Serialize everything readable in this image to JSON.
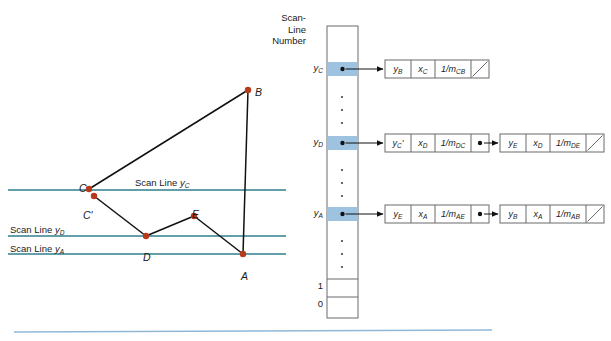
{
  "figure": {
    "title_header": "Scan-\nLine\nNumber",
    "header_lines": [
      "Scan-",
      "Line",
      "Number"
    ]
  },
  "colors": {
    "scanline": "#2e7f8c",
    "vertex": "#b83a1a",
    "highlight": "#9dc3e0",
    "edge": "#111111",
    "box_border": "#6b6b6b",
    "bottom_rule": "#8fb8d8"
  },
  "polygon": {
    "vertices": [
      {
        "id": "B",
        "label": "B",
        "x": 248,
        "y": 90,
        "label_dx": 7,
        "label_dy": -4
      },
      {
        "id": "C",
        "label": "C",
        "x": 89,
        "y": 189,
        "label_dx": -10,
        "label_dy": -7
      },
      {
        "id": "Cp",
        "label": "C'",
        "x": 94,
        "y": 196,
        "label_dx": -11,
        "label_dy": 13
      },
      {
        "id": "D",
        "label": "D",
        "x": 146,
        "y": 236,
        "label_dx": -3,
        "label_dy": 15
      },
      {
        "id": "E",
        "label": "E",
        "x": 194,
        "y": 216,
        "label_dx": -2,
        "label_dy": -8
      },
      {
        "id": "A",
        "label": "A",
        "x": 243,
        "y": 254,
        "label_dx": -2,
        "label_dy": 16
      }
    ],
    "edges": [
      {
        "from": "C",
        "to": "B"
      },
      {
        "from": "B",
        "to": "A"
      },
      {
        "from": "Cp",
        "to": "D"
      },
      {
        "from": "D",
        "to": "E"
      },
      {
        "from": "E",
        "to": "A"
      }
    ]
  },
  "scan_lines": [
    {
      "id": "yC",
      "label": "Scan Line y",
      "sub": "C",
      "y": 190,
      "x1": 8,
      "x2": 286,
      "label_x": 135,
      "label_y": 177,
      "label_align": "left"
    },
    {
      "id": "yD",
      "label": "Scan Line y",
      "sub": "D",
      "y": 236,
      "x1": 8,
      "x2": 286,
      "label_x": 10,
      "label_y": 224,
      "label_align": "left"
    },
    {
      "id": "yA",
      "label": "Scan Line y",
      "sub": "A",
      "y": 254,
      "x1": 8,
      "x2": 286,
      "label_x": 10,
      "label_y": 243,
      "label_align": "left"
    }
  ],
  "bottom_rule": {
    "y": 332,
    "x1": 14,
    "x2": 492
  },
  "scan_table": {
    "x": 327,
    "y_top": 26,
    "width": 31,
    "y_bottom": 318,
    "header_x": 288,
    "header_y": 12,
    "rows": [
      {
        "label": "y",
        "sub": "C",
        "y": 69,
        "highlight": true,
        "has_pointer": true
      },
      {
        "label": "y",
        "sub": "D",
        "y": 143,
        "highlight": true,
        "has_pointer": true
      },
      {
        "label": "y",
        "sub": "A",
        "y": 214,
        "highlight": true,
        "has_pointer": true
      },
      {
        "label": "1",
        "sub": "",
        "y": 287,
        "highlight": false,
        "has_pointer": false
      },
      {
        "label": "0",
        "sub": "",
        "y": 305,
        "highlight": false,
        "has_pointer": false
      }
    ],
    "dot_groups": [
      {
        "x": 342,
        "ys": [
          97,
          110,
          123
        ]
      },
      {
        "x": 342,
        "ys": [
          170,
          183,
          196
        ]
      },
      {
        "x": 342,
        "ys": [
          241,
          254,
          267
        ]
      }
    ]
  },
  "edge_lists": [
    {
      "row": "yC",
      "y": 69,
      "nodes": [
        {
          "x": 385,
          "cells": [
            {
              "main": "y",
              "sub": "B",
              "type": "var"
            },
            {
              "main": "x",
              "sub": "C",
              "type": "var"
            },
            {
              "main": "1/m",
              "sub": "CB",
              "type": "slope"
            },
            {
              "main": "",
              "sub": "",
              "type": "null"
            }
          ]
        }
      ]
    },
    {
      "row": "yD",
      "y": 143,
      "nodes": [
        {
          "x": 385,
          "cells": [
            {
              "main": "y",
              "sub": "C",
              "type": "var",
              "prime": true
            },
            {
              "main": "x",
              "sub": "D",
              "type": "var"
            },
            {
              "main": "1/m",
              "sub": "DC",
              "type": "slope"
            },
            {
              "main": "",
              "sub": "",
              "type": "ptr"
            }
          ]
        },
        {
          "x": 500,
          "cells": [
            {
              "main": "y",
              "sub": "E",
              "type": "var"
            },
            {
              "main": "x",
              "sub": "D",
              "type": "var"
            },
            {
              "main": "1/m",
              "sub": "DE",
              "type": "slope"
            },
            {
              "main": "",
              "sub": "",
              "type": "null"
            }
          ]
        }
      ]
    },
    {
      "row": "yA",
      "y": 214,
      "nodes": [
        {
          "x": 385,
          "cells": [
            {
              "main": "y",
              "sub": "E",
              "type": "var"
            },
            {
              "main": "x",
              "sub": "A",
              "type": "var"
            },
            {
              "main": "1/m",
              "sub": "AE",
              "type": "slope"
            },
            {
              "main": "",
              "sub": "",
              "type": "ptr"
            }
          ]
        },
        {
          "x": 500,
          "cells": [
            {
              "main": "y",
              "sub": "B",
              "type": "var"
            },
            {
              "main": "x",
              "sub": "A",
              "type": "var"
            },
            {
              "main": "1/m",
              "sub": "AB",
              "type": "slope"
            },
            {
              "main": "",
              "sub": "",
              "type": "null"
            }
          ]
        }
      ]
    }
  ]
}
